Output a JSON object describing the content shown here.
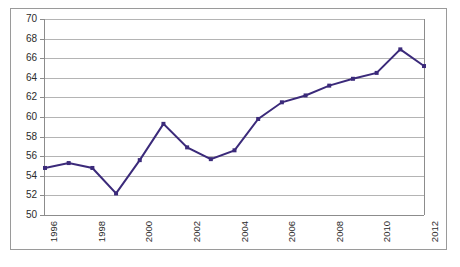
{
  "chart_data": {
    "type": "line",
    "title": "",
    "subtitle": "",
    "xlabel": "",
    "ylabel": "",
    "x": [
      1996,
      1997,
      1998,
      1999,
      2000,
      2001,
      2002,
      2003,
      2004,
      2005,
      2006,
      2007,
      2008,
      2009,
      2010,
      2011,
      2012
    ],
    "values": [
      54.8,
      55.3,
      54.8,
      52.2,
      55.6,
      59.3,
      56.9,
      55.7,
      56.6,
      59.8,
      61.5,
      62.2,
      63.2,
      63.9,
      64.5,
      66.9,
      65.2
    ],
    "series": [
      {
        "name": "",
        "values": [
          54.8,
          55.3,
          54.8,
          52.2,
          55.6,
          59.3,
          56.9,
          55.7,
          56.6,
          59.8,
          61.5,
          62.2,
          63.2,
          63.9,
          64.5,
          66.9,
          65.2
        ]
      }
    ],
    "ylim": [
      50,
      70
    ],
    "xlim": [
      1996,
      2012
    ],
    "yticks": [
      50,
      52,
      54,
      56,
      58,
      60,
      62,
      64,
      66,
      68,
      70
    ],
    "ytick_labels": [
      "50",
      "52",
      "54",
      "56",
      "58",
      "60",
      "62",
      "64",
      "66",
      "68",
      "70"
    ],
    "xticks": [
      1996,
      1998,
      2000,
      2002,
      2004,
      2006,
      2008,
      2010,
      2012
    ],
    "xtick_labels": [
      "1996",
      "1998",
      "2000",
      "2002",
      "2004",
      "2006",
      "2008",
      "2010",
      "2012"
    ],
    "xtick_rotation": 90,
    "grid": "horizontal",
    "legend": "none",
    "annotations": [],
    "colors": {
      "line": "#3B2A7A",
      "marker": "#3B2A7A",
      "gridline": "#b4b4b4",
      "axis": "#8c8c8c",
      "border": "#9a9a9a",
      "background": "#ffffff",
      "tick_label": "#2b2b2b"
    },
    "marker": "square",
    "marker_size": 4,
    "line_width": 2
  }
}
